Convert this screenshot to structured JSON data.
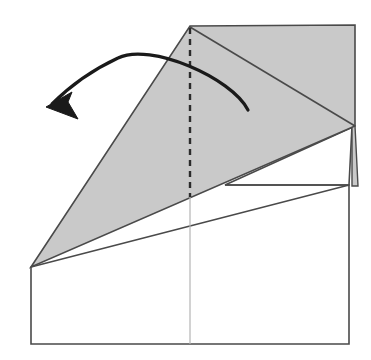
{
  "figure": {
    "type": "paper-folding-diagram",
    "canvas": {
      "width": 371,
      "height": 360
    },
    "background_color": "#ffffff",
    "colors": {
      "paper_fill": "#ffffff",
      "folded_flap_fill": "#c9c9c9",
      "outline_stroke": "#4a4a4a",
      "crease_dashed_stroke": "#2b2b2b",
      "light_crease_stroke": "#b4b4b4",
      "arrow_stroke": "#1a1a1a"
    },
    "stroke_widths": {
      "outline": 1.6,
      "crease_dashed": 2.4,
      "light_crease": 1.2,
      "arrow": 3.2
    },
    "shapes": [
      {
        "name": "base-square-sheet",
        "role": "underlying square paper sheet",
        "fill": "#ffffff",
        "stroke": "#4a4a4a",
        "points": "31,267 349,185 349,344 31,344"
      },
      {
        "name": "upper-right-flap-panel",
        "role": "white panel behind folded flap, right side",
        "fill": "#ffffff",
        "stroke": "#4a4a4a",
        "points": "225,185 349,185 352,126 355,126"
      },
      {
        "name": "folded-gray-flap",
        "role": "large shaded triangular flap to be unfolded",
        "fill": "#c9c9c9",
        "stroke": "#4a4a4a",
        "points": "190,26 355,25 355,126 31,267"
      },
      {
        "name": "gray-sliver-right",
        "role": "thin shaded sliver along right edge below flap vertex",
        "fill": "#c9c9c9",
        "stroke": "#4a4a4a",
        "points": "355,126 358,186 352,186 352,126"
      }
    ],
    "lines": [
      {
        "name": "flap-diagonal-crease",
        "role": "diagonal crease from top apex to right vertex",
        "style": "solid",
        "x1": 190,
        "y1": 27,
        "x2": 355,
        "y2": 126
      },
      {
        "name": "flap-left-slant-edge",
        "role": "left slanted raw edge of folded flap",
        "style": "solid",
        "x1": 190,
        "y1": 26,
        "x2": 31,
        "y2": 267
      },
      {
        "name": "horizontal-panel-edge",
        "role": "horizontal edge of the white panel",
        "style": "solid",
        "x1": 225,
        "y1": 185,
        "x2": 349,
        "y2": 185
      },
      {
        "name": "center-vertical-crease-dashed",
        "role": "dashed vertical center crease (mountain/valley reference)",
        "style": "dashed",
        "x1": 190,
        "y1": 28,
        "x2": 190,
        "y2": 197
      },
      {
        "name": "center-vertical-crease-light",
        "role": "faint vertical center line across lower sheet",
        "style": "light",
        "x1": 190,
        "y1": 197,
        "x2": 190,
        "y2": 344
      }
    ],
    "arrow": {
      "name": "unfold-direction-arrow",
      "role": "curved arrow showing the flap swinging to the left",
      "direction": "right-to-left",
      "path": "M 248,110 C 232,78 150,42 118,58 C 90,71 66,90 52,104",
      "head_points": "46,107 72,92 68,102 78,119",
      "tip": {
        "x": 46,
        "y": 107
      },
      "tail": {
        "x": 248,
        "y": 110
      }
    }
  }
}
